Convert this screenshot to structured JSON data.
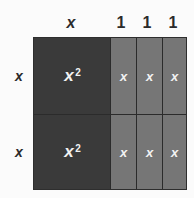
{
  "diagram": {
    "background_color": "#fbfbfb",
    "colors": {
      "dark_tile": "#3a3a3a",
      "light_tile": "#767676",
      "grid_line": "#2b2b2b",
      "label_text": "#2b2b2b",
      "tile_text": "#f2f2f2"
    },
    "column_labels": [
      {
        "text": "x",
        "style": "italic"
      },
      {
        "text": "1",
        "style": "upright"
      },
      {
        "text": "1",
        "style": "upright"
      },
      {
        "text": "1",
        "style": "upright"
      }
    ],
    "row_labels": [
      {
        "text": "x",
        "style": "italic"
      },
      {
        "text": "x",
        "style": "italic"
      }
    ],
    "cells": [
      [
        {
          "base": "x",
          "exponent": "2",
          "shade": "dark"
        },
        {
          "base": "x",
          "exponent": "",
          "shade": "light"
        },
        {
          "base": "x",
          "exponent": "",
          "shade": "light"
        },
        {
          "base": "x",
          "exponent": "",
          "shade": "light"
        }
      ],
      [
        {
          "base": "x",
          "exponent": "2",
          "shade": "dark"
        },
        {
          "base": "x",
          "exponent": "",
          "shade": "light"
        },
        {
          "base": "x",
          "exponent": "",
          "shade": "light"
        },
        {
          "base": "x",
          "exponent": "",
          "shade": "light"
        }
      ]
    ]
  }
}
